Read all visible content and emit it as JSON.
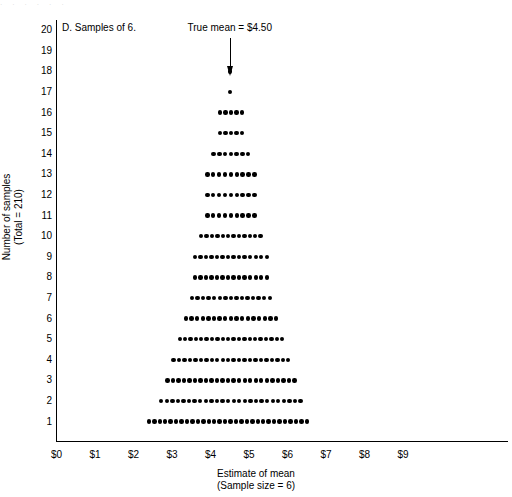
{
  "figure": {
    "panel_label": "D. Samples of 6.",
    "true_mean_label": "True mean = $4.50",
    "top_bleed_text": "·  ·  ·  ·  ·  ·"
  },
  "chart_data": {
    "type": "scatter",
    "plot_style": "dot-plot (stacked frequency dots)",
    "title": "D. Samples of 6.",
    "xlabel": "Estimate of mean",
    "xlabel_sub": "(Sample size = 6)",
    "ylabel": "Number of samples",
    "ylabel_sub": "(Total = 210)",
    "xlim": [
      0,
      9.8
    ],
    "ylim": [
      0,
      20.5
    ],
    "grid": false,
    "legend": false,
    "x_tick_labels": [
      "$0",
      "$1",
      "$2",
      "$3",
      "$4",
      "$5",
      "$6",
      "$7",
      "$8",
      "$9"
    ],
    "x_tick_values": [
      0,
      1,
      2,
      3,
      4,
      5,
      6,
      7,
      8,
      9
    ],
    "y_tick_labels": [
      "1",
      "2",
      "3",
      "4",
      "5",
      "6",
      "7",
      "8",
      "9",
      "10",
      "11",
      "12",
      "13",
      "14",
      "15",
      "16",
      "17",
      "18",
      "19",
      "20"
    ],
    "y_tick_values": [
      1,
      2,
      3,
      4,
      5,
      6,
      7,
      8,
      9,
      10,
      11,
      12,
      13,
      14,
      15,
      16,
      17,
      18,
      19,
      20
    ],
    "total_samples": 210,
    "sample_size": 6,
    "true_mean": 4.5,
    "annotations": [
      {
        "text": "True mean = $4.50",
        "x": 4.5,
        "y": 20.4,
        "arrow_to_y": 18.6
      }
    ],
    "dot_spacing_dollars": 0.16,
    "rows": [
      {
        "y": 1,
        "count": 30,
        "x_start": 2.4,
        "x_end": 6.5
      },
      {
        "y": 2,
        "count": 26,
        "x_start": 2.72,
        "x_end": 6.34
      },
      {
        "y": 3,
        "count": 24,
        "x_start": 2.88,
        "x_end": 6.18
      },
      {
        "y": 4,
        "count": 22,
        "x_start": 3.04,
        "x_end": 6.02
      },
      {
        "y": 5,
        "count": 20,
        "x_start": 3.2,
        "x_end": 5.86
      },
      {
        "y": 6,
        "count": 17,
        "x_start": 3.36,
        "x_end": 5.7
      },
      {
        "y": 7,
        "count": 15,
        "x_start": 3.52,
        "x_end": 5.54
      },
      {
        "y": 8,
        "count": 14,
        "x_start": 3.6,
        "x_end": 5.46
      },
      {
        "y": 9,
        "count": 14,
        "x_start": 3.6,
        "x_end": 5.46
      },
      {
        "y": 10,
        "count": 12,
        "x_start": 3.76,
        "x_end": 5.3
      },
      {
        "y": 11,
        "count": 9,
        "x_start": 3.92,
        "x_end": 5.14
      },
      {
        "y": 12,
        "count": 9,
        "x_start": 3.92,
        "x_end": 5.14
      },
      {
        "y": 13,
        "count": 9,
        "x_start": 3.92,
        "x_end": 5.14
      },
      {
        "y": 14,
        "count": 7,
        "x_start": 4.08,
        "x_end": 4.98
      },
      {
        "y": 15,
        "count": 5,
        "x_start": 4.24,
        "x_end": 4.82
      },
      {
        "y": 16,
        "count": 5,
        "x_start": 4.24,
        "x_end": 4.82
      },
      {
        "y": 17,
        "count": 1,
        "x_start": 4.5,
        "x_end": 4.5
      },
      {
        "y": 18,
        "count": 1,
        "x_start": 4.5,
        "x_end": 4.5
      },
      {
        "y": 19,
        "count": 0,
        "x_start": null,
        "x_end": null
      },
      {
        "y": 20,
        "count": 0,
        "x_start": null,
        "x_end": null
      }
    ]
  }
}
